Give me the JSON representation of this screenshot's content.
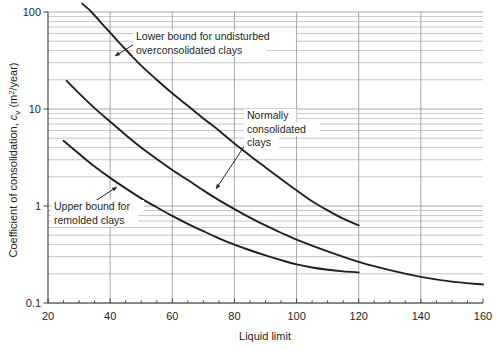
{
  "chart_data": {
    "type": "line",
    "title": "",
    "xlabel": "Liquid limit",
    "ylabel": "Coefficient of consolidation, c_v (m²/year)",
    "ylabel_parts": {
      "lead": "Coefficient of consolidation, ",
      "symbol": "c",
      "symbol_sub": "v",
      "units_open": " (m",
      "units_sup": "2",
      "units_close": "/year)"
    },
    "x_scale": "linear",
    "y_scale": "log",
    "xlim": [
      20,
      160
    ],
    "ylim": [
      0.1,
      100
    ],
    "x_ticks": [
      20,
      40,
      60,
      80,
      100,
      120,
      140,
      160
    ],
    "x_tick_labels": [
      "20",
      "40",
      "60",
      "80",
      "100",
      "120",
      "140",
      "160"
    ],
    "x_minor_tick_step": 5,
    "y_ticks": [
      0.1,
      1,
      10,
      100
    ],
    "y_tick_labels": [
      "0.1",
      "1",
      "10",
      "100"
    ],
    "grid": "log-minor-horizontal-and-major-vertical",
    "grid_color": "#9a9a9a",
    "curve_color": "#231f20",
    "series": [
      {
        "name": "Lower bound for undisturbed overconsolidated clays",
        "points": [
          [
            31,
            122
          ],
          [
            34,
            100
          ],
          [
            38,
            72
          ],
          [
            42,
            52
          ],
          [
            46,
            38
          ],
          [
            50,
            28
          ],
          [
            55,
            20
          ],
          [
            60,
            14.5
          ],
          [
            65,
            10.8
          ],
          [
            70,
            8.0
          ],
          [
            75,
            6.0
          ],
          [
            80,
            4.4
          ],
          [
            85,
            3.3
          ],
          [
            90,
            2.5
          ],
          [
            95,
            1.9
          ],
          [
            100,
            1.45
          ],
          [
            105,
            1.12
          ],
          [
            110,
            0.9
          ],
          [
            115,
            0.74
          ],
          [
            120,
            0.63
          ]
        ]
      },
      {
        "name": "Normally consolidated clays",
        "points": [
          [
            26,
            19.5
          ],
          [
            30,
            14.5
          ],
          [
            35,
            10.2
          ],
          [
            40,
            7.4
          ],
          [
            45,
            5.4
          ],
          [
            50,
            4.0
          ],
          [
            55,
            3.05
          ],
          [
            60,
            2.35
          ],
          [
            65,
            1.85
          ],
          [
            70,
            1.45
          ],
          [
            75,
            1.15
          ],
          [
            80,
            0.93
          ],
          [
            85,
            0.76
          ],
          [
            90,
            0.63
          ],
          [
            95,
            0.53
          ],
          [
            100,
            0.45
          ],
          [
            110,
            0.34
          ],
          [
            120,
            0.265
          ],
          [
            130,
            0.218
          ],
          [
            140,
            0.186
          ],
          [
            150,
            0.166
          ],
          [
            160,
            0.155
          ]
        ]
      },
      {
        "name": "Upper bound for remolded clays",
        "points": [
          [
            25,
            4.7
          ],
          [
            30,
            3.45
          ],
          [
            35,
            2.55
          ],
          [
            40,
            1.95
          ],
          [
            45,
            1.52
          ],
          [
            50,
            1.2
          ],
          [
            55,
            0.97
          ],
          [
            60,
            0.79
          ],
          [
            65,
            0.655
          ],
          [
            70,
            0.55
          ],
          [
            75,
            0.465
          ],
          [
            80,
            0.4
          ],
          [
            85,
            0.35
          ],
          [
            90,
            0.31
          ],
          [
            95,
            0.277
          ],
          [
            100,
            0.25
          ],
          [
            105,
            0.232
          ],
          [
            110,
            0.22
          ],
          [
            115,
            0.212
          ],
          [
            120,
            0.207
          ]
        ]
      }
    ],
    "annotations": [
      {
        "name": "lower-bound-annotation",
        "lines": [
          "Lower bound for undisturbed",
          "overconsolidated clays"
        ],
        "text_x": 136,
        "text_y": 40,
        "leader": [
          [
            133,
            45
          ],
          [
            115,
            56
          ]
        ]
      },
      {
        "name": "normally-consolidated-annotation",
        "lines": [
          "Normally",
          "consolidated",
          "clays"
        ],
        "text_x": 247,
        "text_y": 119,
        "leader": [
          [
            245,
            145
          ],
          [
            216,
            189
          ]
        ]
      },
      {
        "name": "upper-bound-annotation",
        "lines": [
          "Upper bound for",
          "remolded clays"
        ],
        "text_x": 54,
        "text_y": 210,
        "leader": [
          [
            92,
            203
          ],
          [
            117,
            187
          ]
        ]
      }
    ]
  }
}
